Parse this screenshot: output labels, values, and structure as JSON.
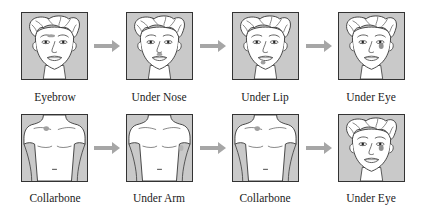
{
  "colors": {
    "panel_bg": "#c9c9c9",
    "skin": "#ffffff",
    "outline": "#333333",
    "arrow": "#a6a6a6",
    "mark": "#a0a0a0"
  },
  "rows": [
    {
      "steps": [
        {
          "label": "Eyebrow",
          "figure": "face",
          "mark": "eyebrow"
        },
        {
          "label": "Under Nose",
          "figure": "face",
          "mark": "under-nose"
        },
        {
          "label": "Under Lip",
          "figure": "face",
          "mark": "under-lip"
        },
        {
          "label": "Under Eye",
          "figure": "face",
          "mark": "under-eye"
        }
      ]
    },
    {
      "steps": [
        {
          "label": "Collarbone",
          "figure": "torso",
          "mark": "collarbone"
        },
        {
          "label": "Under Arm",
          "figure": "torso",
          "mark": "under-arm"
        },
        {
          "label": "Collarbone",
          "figure": "torso",
          "mark": "collarbone"
        },
        {
          "label": "Under Eye",
          "figure": "face",
          "mark": "under-eye"
        }
      ]
    }
  ],
  "arrow_icon": "right-arrow-icon"
}
